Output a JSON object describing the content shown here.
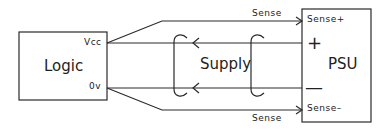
{
  "diagram": {
    "logic_block": {
      "label": "Logic",
      "vcc_pin": "Vcc",
      "gnd_pin": "0v"
    },
    "supply": {
      "label": "Supply"
    },
    "psu_block": {
      "label": "PSU",
      "sense_plus": "Sense+",
      "plus_terminal": "+",
      "minus_terminal": "—",
      "sense_minus": "Sense–"
    },
    "sense_top_label": "Sense",
    "sense_bottom_label": "Sense",
    "colors": {
      "line": "#2a2a2a",
      "background": "#ffffff"
    }
  }
}
